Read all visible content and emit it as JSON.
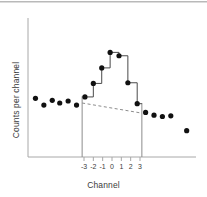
{
  "figure": {
    "background_color": "#ffffff",
    "ink_color": "#1a1a1a",
    "rule_color": "#b9b9b9"
  },
  "chart_data": {
    "type": "scatter",
    "title": "",
    "subtitle": "",
    "xlabel": "Channel",
    "ylabel": "Counts per channel",
    "grid": false,
    "legend": null,
    "xlim": [
      -9,
      9
    ],
    "ylim": [
      0,
      10
    ],
    "xticks": [
      -3,
      -2,
      -1,
      0,
      1,
      2,
      3
    ],
    "xtick_labels": [
      "-3",
      "-2",
      "-1",
      "0",
      "1",
      "2",
      "3"
    ],
    "yticks": [],
    "ytick_labels": [],
    "axis_style": "left-and-bottom-spine",
    "series": [
      {
        "name": "Counts per channel",
        "type": "scatter",
        "marker": "filled-circle",
        "color": "#111111",
        "points": [
          {
            "x": -8.2,
            "y": 4.35
          },
          {
            "x": -7.3,
            "y": 3.85
          },
          {
            "x": -6.4,
            "y": 4.2
          },
          {
            "x": -5.6,
            "y": 4.0
          },
          {
            "x": -4.7,
            "y": 4.15
          },
          {
            "x": -3.8,
            "y": 3.85
          },
          {
            "x": -2.9,
            "y": 4.45
          },
          {
            "x": -2.0,
            "y": 5.45
          },
          {
            "x": -1.1,
            "y": 6.6
          },
          {
            "x": -0.2,
            "y": 7.75
          },
          {
            "x": 0.75,
            "y": 7.5
          },
          {
            "x": 1.7,
            "y": 5.5
          },
          {
            "x": 2.7,
            "y": 3.95
          },
          {
            "x": 3.6,
            "y": 3.3
          },
          {
            "x": 4.5,
            "y": 3.1
          },
          {
            "x": 5.4,
            "y": 3.0
          },
          {
            "x": 6.3,
            "y": 3.05
          },
          {
            "x": 8.0,
            "y": 1.95
          }
        ]
      },
      {
        "name": "Histogram step outline",
        "type": "step",
        "color": "#4a4a4a",
        "x_edges": [
          -2.9,
          -2.0,
          -1.1,
          -0.2,
          0.75,
          1.7,
          2.7,
          3.2
        ],
        "values": [
          4.45,
          5.45,
          6.6,
          7.75,
          7.5,
          5.5,
          3.95
        ]
      },
      {
        "name": "Background continuum",
        "type": "line",
        "style": "dashed",
        "color": "#8c8c8c",
        "points": [
          {
            "x": -3.2,
            "y": 4.0
          },
          {
            "x": 3.2,
            "y": 3.25
          }
        ]
      }
    ],
    "annotations": [
      {
        "name": "region-of-interest-left-boundary",
        "type": "vertical-line",
        "x": -3.2,
        "y_from": 0,
        "y_to": 4.5,
        "color": "#8c8c8c"
      },
      {
        "name": "region-of-interest-right-boundary",
        "type": "vertical-line",
        "x": 3.2,
        "y_from": 0,
        "y_to": 4.0,
        "color": "#8c8c8c"
      }
    ]
  }
}
